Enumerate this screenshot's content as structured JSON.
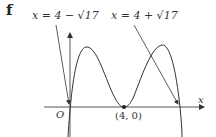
{
  "part": "f",
  "labels": {
    "left_asymptote": "x = 4 − √17",
    "right_asymptote": "x = 4 + √17"
  },
  "axes": {
    "origin": "O",
    "x_label": "x",
    "point": "(4, 0)"
  },
  "colors": {
    "stroke": "#333333",
    "axis": "#555555"
  }
}
